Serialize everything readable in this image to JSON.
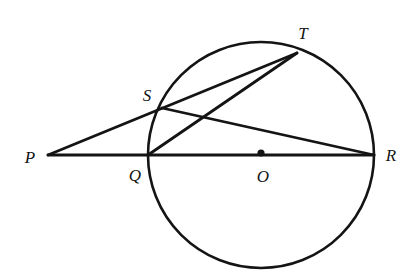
{
  "figure": {
    "width": 409,
    "height": 275,
    "background_color": "#ffffff",
    "stroke_color": "#141414",
    "stroke_width": 2.6,
    "label_color": "#141414"
  },
  "chart_data": {
    "type": "diagram",
    "xlabel": "",
    "ylabel": "",
    "circle": {
      "center_label": "O",
      "center": [
        261,
        155
      ],
      "radius": 113
    },
    "points": [
      {
        "label": "P",
        "x": 48,
        "y": 155,
        "on_circle": false,
        "marker": false,
        "label_x": 30,
        "label_y": 157
      },
      {
        "label": "Q",
        "x": 148,
        "y": 155,
        "on_circle": true,
        "marker": false,
        "label_x": 135,
        "label_y": 175
      },
      {
        "label": "O",
        "x": 261,
        "y": 153,
        "on_circle": false,
        "marker": true,
        "label_x": 263,
        "label_y": 176
      },
      {
        "label": "R",
        "x": 374,
        "y": 155,
        "on_circle": true,
        "marker": false,
        "label_x": 391,
        "label_y": 155
      },
      {
        "label": "S",
        "x": 162,
        "y": 108,
        "on_circle": true,
        "marker": false,
        "label_x": 147,
        "label_y": 95
      },
      {
        "label": "T",
        "x": 297,
        "y": 53,
        "on_circle": true,
        "marker": false,
        "label_x": 303,
        "label_y": 33
      }
    ],
    "segments": [
      {
        "name": "PR",
        "from": "P",
        "to": "R",
        "x1": 48,
        "y1": 155,
        "x2": 374,
        "y2": 155
      },
      {
        "name": "PT",
        "from": "P",
        "to": "T",
        "x1": 48,
        "y1": 155,
        "x2": 297,
        "y2": 53
      },
      {
        "name": "SR",
        "from": "S",
        "to": "R",
        "x1": 162,
        "y1": 108,
        "x2": 374,
        "y2": 155
      },
      {
        "name": "QT",
        "from": "Q",
        "to": "T",
        "x1": 148,
        "y1": 155,
        "x2": 297,
        "y2": 53
      }
    ],
    "labels": [
      "P",
      "Q",
      "O",
      "R",
      "S",
      "T"
    ]
  }
}
